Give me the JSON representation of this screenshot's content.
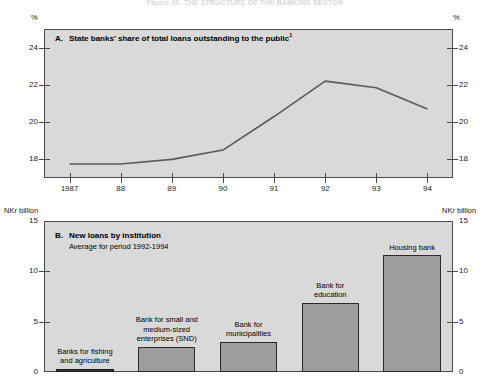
{
  "figure": {
    "top_title": "Figure 20.  THE STRUCTURE OF THE BANKING SECTOR",
    "unit_a_left": "%",
    "unit_a_right": "%",
    "unit_b_left": "NKr billion",
    "unit_b_right": "NKr billion"
  },
  "panel_a": {
    "letter": "A.",
    "title": "State banks' share of total loans outstanding to the public",
    "footnote_marker": "1"
  },
  "panel_b": {
    "letter": "B.",
    "title": "New loans by institution",
    "subtitle": "Average for period 1992-1994"
  },
  "chart_data": [
    {
      "type": "line",
      "title": "A. State banks' share of total loans outstanding to the public",
      "xlabel": "",
      "ylabel": "%",
      "x": [
        1987,
        1988,
        1989,
        1990,
        1991,
        1992,
        1993,
        1994
      ],
      "tick_labels": [
        "1987",
        "88",
        "89",
        "90",
        "91",
        "92",
        "93",
        "94"
      ],
      "values": [
        17.75,
        17.75,
        18.0,
        18.5,
        20.3,
        22.2,
        21.85,
        20.7
      ],
      "ylim": [
        17.0,
        25.0
      ],
      "yticks": [
        18,
        20,
        22,
        24
      ],
      "ytick_labels": [
        "18",
        "20",
        "22",
        "24"
      ],
      "grid": false,
      "legend": "none",
      "line_color": "#5a5a5a"
    },
    {
      "type": "bar",
      "title": "B. New loans by institution",
      "subtitle": "Average for period 1992-1994",
      "xlabel": "",
      "ylabel": "NKr billion",
      "categories": [
        "Banks for fishing\nand agriculture",
        "Bank for small and\nmedium-sized\nenterprises (SND)",
        "Bank for\nmunicipalities",
        "Bank for\neducation",
        "Housing bank"
      ],
      "values": [
        0.3,
        2.5,
        3.0,
        6.9,
        11.6
      ],
      "ylim": [
        0,
        15
      ],
      "yticks": [
        0,
        5,
        10,
        15
      ],
      "ytick_labels": [
        "0",
        "5",
        "10",
        "15"
      ],
      "grid": false,
      "legend": "none",
      "bar_color": "#9d9d9d",
      "bar_edge_color": "#2a2a2a"
    }
  ]
}
